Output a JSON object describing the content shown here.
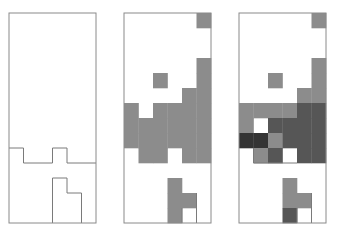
{
  "figure": {
    "grid": {
      "cols": 6,
      "rows": 14
    },
    "colors": {
      "0": "#ffffff",
      "1": "#8c8c8c",
      "2": "#565656",
      "3": "#343434",
      "border": "#8a8a8a",
      "outline": "#7a7a7a"
    },
    "panels": [
      {
        "name": "panel-outline",
        "x": 9,
        "y": 13,
        "w": 87,
        "h": 210,
        "cells": [
          [
            0,
            0,
            0,
            0,
            0,
            0
          ],
          [
            0,
            0,
            0,
            0,
            0,
            0
          ],
          [
            0,
            0,
            0,
            0,
            0,
            0
          ],
          [
            0,
            0,
            0,
            0,
            0,
            0
          ],
          [
            0,
            0,
            0,
            0,
            0,
            0
          ],
          [
            0,
            0,
            0,
            0,
            0,
            0
          ],
          [
            0,
            0,
            0,
            0,
            0,
            0
          ],
          [
            0,
            0,
            0,
            0,
            0,
            0
          ],
          [
            0,
            0,
            0,
            0,
            0,
            0
          ],
          [
            0,
            0,
            0,
            0,
            0,
            0
          ],
          [
            0,
            0,
            0,
            0,
            0,
            0
          ],
          [
            0,
            0,
            0,
            0,
            0,
            0
          ],
          [
            0,
            0,
            0,
            0,
            0,
            0
          ],
          [
            0,
            0,
            0,
            0,
            0,
            0
          ]
        ],
        "outlines": [
          [
            [
              0,
              9
            ],
            [
              1,
              9
            ],
            [
              1,
              10
            ],
            [
              3,
              10
            ],
            [
              3,
              9
            ],
            [
              4,
              9
            ],
            [
              4,
              10
            ],
            [
              6,
              10
            ]
          ],
          [
            [
              3,
              14
            ],
            [
              3,
              11
            ],
            [
              4,
              11
            ],
            [
              4,
              12
            ],
            [
              5,
              12
            ],
            [
              5,
              14
            ]
          ]
        ]
      },
      {
        "name": "panel-two-level",
        "x": 124,
        "y": 13,
        "w": 87,
        "h": 210,
        "cells": [
          [
            0,
            0,
            0,
            0,
            0,
            1
          ],
          [
            0,
            0,
            0,
            0,
            0,
            0
          ],
          [
            0,
            0,
            0,
            0,
            0,
            0
          ],
          [
            0,
            0,
            0,
            0,
            0,
            1
          ],
          [
            0,
            0,
            1,
            0,
            0,
            1
          ],
          [
            0,
            0,
            0,
            0,
            1,
            1
          ],
          [
            1,
            0,
            1,
            1,
            1,
            1
          ],
          [
            1,
            1,
            1,
            1,
            1,
            1
          ],
          [
            1,
            1,
            1,
            1,
            1,
            1
          ],
          [
            0,
            1,
            1,
            0,
            1,
            1
          ],
          [
            0,
            0,
            0,
            0,
            0,
            0
          ],
          [
            0,
            0,
            0,
            1,
            0,
            0
          ],
          [
            0,
            0,
            0,
            1,
            1,
            0
          ],
          [
            0,
            0,
            0,
            1,
            0,
            0
          ]
        ],
        "outlines": [
          [
            [
              4,
              13
            ],
            [
              4,
              14
            ]
          ],
          [
            [
              5,
              12
            ],
            [
              5,
              14
            ]
          ]
        ]
      },
      {
        "name": "panel-multi-level",
        "x": 239,
        "y": 13,
        "w": 87,
        "h": 210,
        "cells": [
          [
            0,
            0,
            0,
            0,
            0,
            1
          ],
          [
            0,
            0,
            0,
            0,
            0,
            0
          ],
          [
            0,
            0,
            0,
            0,
            0,
            0
          ],
          [
            0,
            0,
            0,
            0,
            0,
            1
          ],
          [
            0,
            0,
            1,
            0,
            0,
            1
          ],
          [
            0,
            0,
            0,
            0,
            1,
            1
          ],
          [
            1,
            1,
            1,
            1,
            2,
            2
          ],
          [
            1,
            0,
            2,
            2,
            2,
            2
          ],
          [
            3,
            3,
            1,
            2,
            2,
            2
          ],
          [
            0,
            1,
            2,
            0,
            2,
            2
          ],
          [
            0,
            0,
            0,
            0,
            0,
            0
          ],
          [
            0,
            0,
            0,
            1,
            0,
            0
          ],
          [
            0,
            0,
            0,
            1,
            1,
            0
          ],
          [
            0,
            0,
            0,
            2,
            0,
            0
          ]
        ],
        "outlines": [
          [
            [
              4,
              13
            ],
            [
              4,
              14
            ]
          ],
          [
            [
              5,
              12
            ],
            [
              5,
              14
            ]
          ],
          [
            [
              1,
              9
            ],
            [
              1,
              10
            ],
            [
              4,
              10
            ]
          ]
        ]
      }
    ]
  }
}
